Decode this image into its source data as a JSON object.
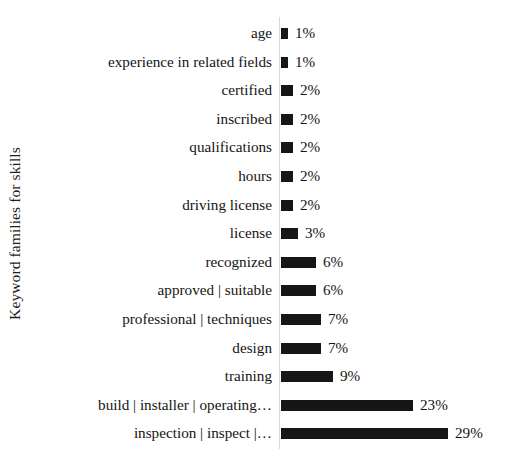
{
  "chart_data": {
    "type": "bar",
    "orientation": "horizontal",
    "title": "",
    "xlabel": "",
    "ylabel": "Keyword families for skills",
    "xlim": [
      0,
      30
    ],
    "grid": false,
    "legend": null,
    "value_suffix": "%",
    "categories": [
      "age",
      "experience in related fields",
      "certified",
      "inscribed",
      "qualifications",
      "hours",
      "driving license",
      "license",
      "recognized",
      "approved | suitable",
      "professional | techniques",
      "design",
      "training",
      "build | installer | operating…",
      "inspection | inspect |…"
    ],
    "values": [
      1,
      1,
      2,
      2,
      2,
      2,
      2,
      3,
      6,
      6,
      7,
      7,
      9,
      23,
      29
    ],
    "value_labels": [
      "1%",
      "1%",
      "2%",
      "2%",
      "2%",
      "2%",
      "2%",
      "3%",
      "6%",
      "6%",
      "7%",
      "7%",
      "9%",
      "23%",
      "29%"
    ],
    "bar_color": "#161616",
    "background_color": "#ffffff",
    "axis_color": "#d8d8d8"
  },
  "layout": {
    "bar_origin_x": 281,
    "px_per_percent": 5.76,
    "first_row_center_y": 33,
    "row_spacing": 28.6,
    "bar_height": 11,
    "min_bar_width": 7
  }
}
